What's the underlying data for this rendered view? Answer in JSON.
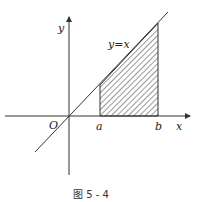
{
  "figure": {
    "caption": "图 5 - 4",
    "labels": {
      "y_axis": "y",
      "x_axis": "x",
      "origin": "O",
      "a": "a",
      "b": "b",
      "curve": "y=x"
    }
  }
}
